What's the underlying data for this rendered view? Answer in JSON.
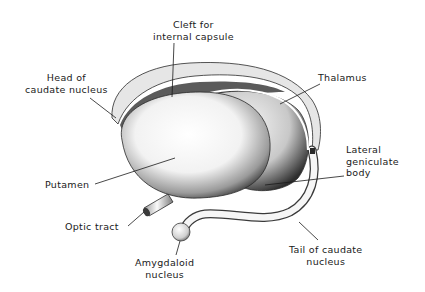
{
  "diagram": {
    "colors": {
      "background": "#ffffff",
      "ink": "#1a1a1a",
      "shade_dark": "#3a3a3a",
      "shade_mid": "#8a8a8a",
      "highlight": "#f4f4f4"
    },
    "labels": {
      "cleft": {
        "line1": "Cleft for",
        "line2": "internal capsule"
      },
      "head_caudate": {
        "line1": "Head of",
        "line2": "caudate nucleus"
      },
      "thalamus": {
        "line1": "Thalamus"
      },
      "lateral_geniculate": {
        "line1": "Lateral",
        "line2": "geniculate",
        "line3": "body"
      },
      "putamen": {
        "line1": "Putamen"
      },
      "optic_tract": {
        "line1": "Optic tract"
      },
      "amygdaloid": {
        "line1": "Amygdaloid",
        "line2": "nucleus"
      },
      "tail_caudate": {
        "line1": "Tail of caudate",
        "line2": "nucleus"
      }
    }
  }
}
